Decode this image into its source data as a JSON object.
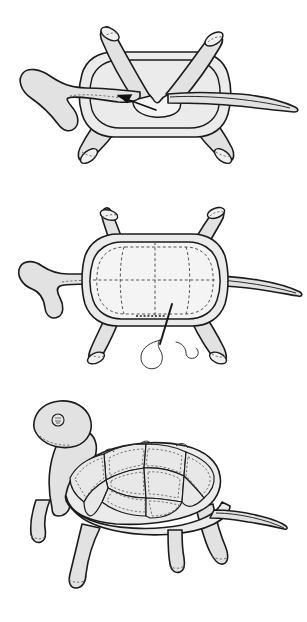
{
  "document": {
    "title": "Stuffed Turtle Assembly Diagram",
    "subject": "plush turtle sewing instructions",
    "background_color": "#ffffff",
    "ink_color": "#1b1b1b",
    "fabric_fill_color": "#e2e2e2",
    "shell_fill_color": "#ebebeb",
    "seam_color": "#555555",
    "panel_count": 3,
    "visible_text": ""
  },
  "panels": [
    {
      "id": "panel-1",
      "data_name": "step-1-attach-limbs",
      "step_number": 1,
      "view": "underside flat view of shell with limbs pinned inward",
      "description": "Turtle shell seen from below with four tube legs, head piece and tapered tail arranged around it; an arrow points to the notched opening at the centre.",
      "caption": "",
      "parts": [
        {
          "name": "shell-underside",
          "shape": "rounded octagon"
        },
        {
          "name": "leg-front-left",
          "shape": "open tube, angled up-left"
        },
        {
          "name": "leg-front-right",
          "shape": "open tube, angled up-right"
        },
        {
          "name": "leg-back-left",
          "shape": "open tube, angled down-left"
        },
        {
          "name": "leg-back-right",
          "shape": "open tube, angled down-right"
        },
        {
          "name": "head-neck-piece",
          "shape": "hooked tube, left side"
        },
        {
          "name": "tail-piece",
          "shape": "long tapered point, right side"
        },
        {
          "name": "centre-opening",
          "shape": "scalloped notch"
        }
      ],
      "annotations": [
        {
          "type": "arrow",
          "data_name": "insert-arrow",
          "points_to": "centre-opening",
          "direction": "right-to-left into notch"
        }
      ]
    },
    {
      "id": "panel-2",
      "data_name": "step-2-stitch-shell",
      "step_number": 2,
      "view": "top view of assembled shell being hand sewn closed",
      "description": "The shell is turned right side out; dashed seam lines cross the shell top. A threaded needle closes the opening at the lower edge with a row of stitches.",
      "caption": "",
      "parts": [
        {
          "name": "shell-top",
          "shape": "rounded octagon with seam cross"
        },
        {
          "name": "shell-rim",
          "shape": "outer band"
        },
        {
          "name": "leg-front-left",
          "shape": "open tube, angled up-left"
        },
        {
          "name": "leg-front-right",
          "shape": "open tube, angled up-right"
        },
        {
          "name": "leg-back-left",
          "shape": "open tube, angled down-left"
        },
        {
          "name": "leg-back-right",
          "shape": "open tube, angled down-right"
        },
        {
          "name": "head-neck-piece",
          "shape": "hooked tube, left side"
        },
        {
          "name": "tail-piece",
          "shape": "long tapered point, right side"
        }
      ],
      "annotations": [
        {
          "type": "needle",
          "data_name": "sewing-needle",
          "location": "bottom centre of shell"
        },
        {
          "type": "thread",
          "data_name": "thread-loop",
          "location": "below needle, curling loop and tail"
        },
        {
          "type": "stitches",
          "data_name": "closing-stitch-row",
          "location": "lower shell edge"
        }
      ]
    },
    {
      "id": "panel-3",
      "data_name": "step-3-finished-turtle",
      "step_number": 3,
      "view": "three quarter side view of the completed stuffed turtle",
      "description": "Finished plush turtle standing on four legs with raised head, button eye, pointed tail and a domed shell quilted into hexagonal plates with dashed topstitching.",
      "caption": "",
      "parts": [
        {
          "name": "head",
          "shape": "rounded oval with button eye"
        },
        {
          "name": "neck",
          "shape": "curved column"
        },
        {
          "name": "shell-dome",
          "shape": "domed carapace with hexagonal plates"
        },
        {
          "name": "shell-rim",
          "shape": "flared lower band"
        },
        {
          "name": "leg-front-left",
          "shape": "tapered tube with dashed cuff"
        },
        {
          "name": "leg-front-right",
          "shape": "tapered tube with dashed cuff"
        },
        {
          "name": "leg-back-left",
          "shape": "tapered tube with dashed cuff"
        },
        {
          "name": "leg-back-right",
          "shape": "tapered tube with dashed cuff"
        },
        {
          "name": "tail",
          "shape": "long tapered point, right side"
        },
        {
          "name": "eye",
          "shape": "small circle with stitch marks"
        }
      ],
      "annotations": [
        {
          "type": "quilting",
          "data_name": "shell-plate-topstitching",
          "location": "each hexagonal shell plate"
        }
      ]
    }
  ]
}
